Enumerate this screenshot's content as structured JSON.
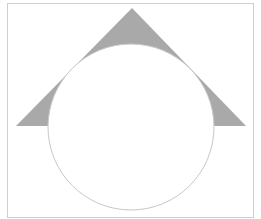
{
  "diagram": {
    "frame": {
      "x": 7,
      "y": 3,
      "width": 246,
      "height": 214,
      "stroke": "#cfcfcf"
    },
    "triangle": {
      "points": [
        [
          132,
          8
        ],
        [
          16,
          126
        ],
        [
          246,
          126
        ]
      ],
      "fill": "#a9a9a9"
    },
    "circle": {
      "cx": 131,
      "cy": 127,
      "r": 83,
      "fill": "#ffffff",
      "stroke": "#c8c8c8"
    }
  }
}
